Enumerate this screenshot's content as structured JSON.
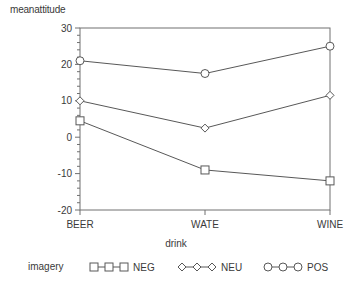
{
  "chart_data": {
    "type": "line",
    "title": "",
    "subtitle": "",
    "ylabel": "meanattitude",
    "xlabel": "drink",
    "categories": [
      "BEER",
      "WATE",
      "WINE"
    ],
    "ylim": [
      -20,
      30
    ],
    "yticks": [
      30,
      20,
      10,
      0,
      -10,
      -20
    ],
    "ytick_labels": [
      "30",
      "20",
      "10",
      "0",
      "-10",
      "-20"
    ],
    "minor_ticks": true,
    "grid": false,
    "legend_title": "imagery",
    "legend_position": "bottom",
    "series": [
      {
        "name": "NEG",
        "marker": "square",
        "values": [
          4.5,
          -9.0,
          -12.0
        ]
      },
      {
        "name": "NEU",
        "marker": "diamond",
        "values": [
          10.0,
          2.5,
          11.5
        ]
      },
      {
        "name": "POS",
        "marker": "circle",
        "values": [
          21.0,
          17.5,
          25.0
        ]
      }
    ],
    "line_color": "#585858",
    "marker_color": "#585858",
    "axis_color": "#707070",
    "text_color": "#3a3a3a"
  },
  "axis": {
    "y_title": "meanattitude",
    "x_title": "drink"
  },
  "legend": {
    "title": "imagery",
    "entries": [
      {
        "label": "NEG",
        "marker": "square"
      },
      {
        "label": "NEU",
        "marker": "diamond"
      },
      {
        "label": "POS",
        "marker": "circle"
      }
    ]
  }
}
